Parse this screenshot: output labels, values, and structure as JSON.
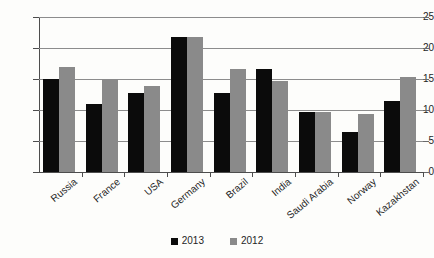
{
  "chart_data": {
    "type": "bar",
    "title": "",
    "subtitle": "",
    "xlabel": "",
    "ylabel": "",
    "ylim": [
      0,
      25
    ],
    "yticks": [
      0,
      5,
      10,
      15,
      20,
      25
    ],
    "grid": true,
    "legend_position": "bottom",
    "categories": [
      "Russia",
      "France",
      "USA",
      "Germany",
      "Brazil",
      "India",
      "Saudi Arabia",
      "Norway",
      "Kazakhstan"
    ],
    "series": [
      {
        "name": "2013",
        "color": "#0b0b0b",
        "values": [
          15.0,
          10.9,
          12.8,
          21.7,
          12.7,
          16.6,
          9.6,
          6.4,
          11.4
        ]
      },
      {
        "name": "2012",
        "color": "#8a8a8a",
        "values": [
          16.9,
          15.0,
          13.8,
          21.7,
          16.6,
          14.7,
          9.6,
          9.4,
          15.4
        ]
      }
    ]
  },
  "axis": {
    "y_tick_labels": [
      "25",
      "20",
      "15",
      "10",
      "5",
      "0"
    ]
  },
  "legend": {
    "items": [
      {
        "label": "2013",
        "swatch": "black-square-icon"
      },
      {
        "label": "2012",
        "swatch": "gray-square-icon"
      }
    ]
  },
  "colors": {
    "series_2013": "#0b0b0b",
    "series_2012": "#8a8a8a",
    "gridline": "#8c8c8c",
    "axis": "#4d4d4d",
    "background": "#fdfdfb"
  }
}
